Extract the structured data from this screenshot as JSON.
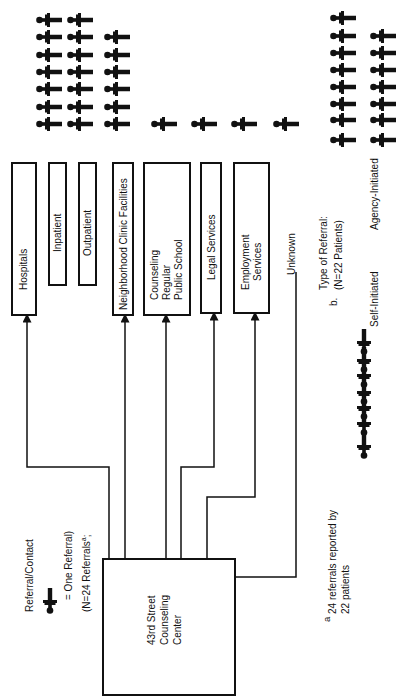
{
  "legend": {
    "title": "Referral/Contact",
    "icon_meaning": "= One Referral)",
    "count_note": "(N=24 Referrals",
    "count_sup": "a",
    "count_tail": ";"
  },
  "center": {
    "lines": [
      "43rd Street",
      "Counseling",
      "Center"
    ]
  },
  "destinations": [
    {
      "id": "hospitals",
      "label": [
        "Hospitals"
      ],
      "count": null
    },
    {
      "id": "inpatient",
      "label": [
        "Inpatient"
      ],
      "count": 7
    },
    {
      "id": "outpatient",
      "label": [
        "Outpatient"
      ],
      "count": 7
    },
    {
      "id": "neighborhood",
      "label": [
        "Neighborhood Clinic Facilities"
      ],
      "count": 6
    },
    {
      "id": "counseling",
      "label": [
        "Counseling",
        "Regular",
        "Public School"
      ],
      "count": 1
    },
    {
      "id": "legal",
      "label": [
        "Legal Services"
      ],
      "count": 1
    },
    {
      "id": "employment",
      "label": [
        "Employment",
        "Services"
      ],
      "count": 1
    },
    {
      "id": "unknown",
      "label": [
        "Unknown"
      ],
      "count": 1
    }
  ],
  "section_b": {
    "prefix": "b.",
    "title": "Type of Referral:",
    "subtitle": "(N=22 Patients)",
    "self_label": "Self-Initiated",
    "self_count": 7,
    "agency_label": "Agency-Initiated",
    "agency_count": 15
  },
  "footnote": {
    "marker": "a",
    "line1": "24 referrals reported by",
    "line2": "22 patients"
  }
}
